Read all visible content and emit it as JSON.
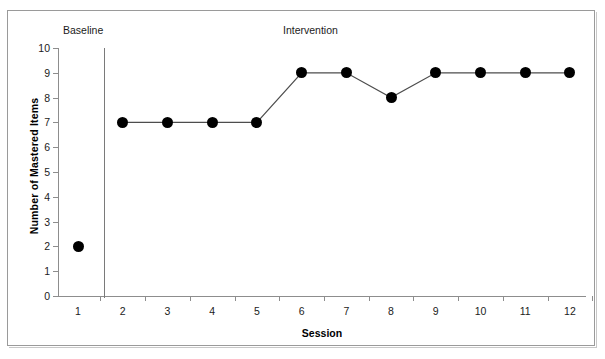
{
  "figure": {
    "top_cut_text": "",
    "frame_border_color": "#9a9a9a"
  },
  "chart_data": {
    "type": "line",
    "title": "",
    "subtitle": "",
    "xlabel": "Session",
    "ylabel": "Number of Mastered Items",
    "x": [
      1,
      2,
      3,
      4,
      5,
      6,
      7,
      8,
      9,
      10,
      11,
      12
    ],
    "xtick_labels": [
      "1",
      "2",
      "3",
      "4",
      "5",
      "6",
      "7",
      "8",
      "9",
      "10",
      "11",
      "12"
    ],
    "ytick_labels": [
      "0",
      "1",
      "2",
      "3",
      "4",
      "5",
      "6",
      "7",
      "8",
      "9",
      "10"
    ],
    "ylim": [
      0,
      10
    ],
    "xlim": [
      0.5,
      12.5
    ],
    "grid": false,
    "legend": "none",
    "marker": "filled-circle",
    "marker_color": "#000000",
    "line_color": "#4d4d4d",
    "series": [
      {
        "name": "Mastered Items",
        "values": [
          2,
          7,
          7,
          7,
          7,
          9,
          9,
          8,
          9,
          9,
          9,
          9
        ]
      }
    ],
    "phases": [
      {
        "label": "Baseline",
        "sessions": [
          1
        ]
      },
      {
        "label": "Intervention",
        "sessions": [
          2,
          3,
          4,
          5,
          6,
          7,
          8,
          9,
          10,
          11,
          12
        ]
      }
    ],
    "phase_divider_between": [
      1,
      2
    ],
    "annotations": [
      {
        "text": "Baseline"
      },
      {
        "text": "Intervention"
      }
    ]
  }
}
